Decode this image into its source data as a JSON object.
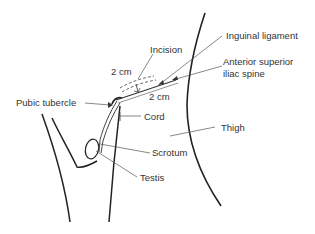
{
  "diagram": {
    "labels": {
      "incision": "Incision",
      "inguinal_ligament": "Inguinal ligament",
      "asis_line1": "Anterior superior",
      "asis_line2": "iliac spine",
      "dim_top": "2 cm",
      "dim_right": "2 cm",
      "pubic_tubercle": "Pubic tubercle",
      "cord": "Cord",
      "thigh": "Thigh",
      "scrotum": "Scrotum",
      "testis": "Testis"
    },
    "colors": {
      "outline": "#222222",
      "leader": "#555555",
      "text": "#333333"
    }
  }
}
